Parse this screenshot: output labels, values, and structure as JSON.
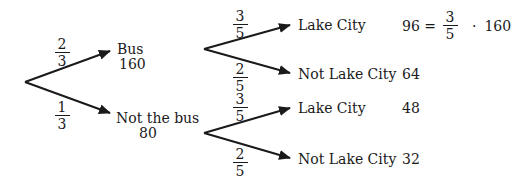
{
  "diagram": {
    "type": "probability-tree",
    "root": {
      "branches": [
        {
          "probability": {
            "num": "2",
            "den": "3"
          },
          "label": "Bus",
          "count": "160",
          "branches": [
            {
              "probability": {
                "num": "3",
                "den": "5"
              },
              "label": "Lake City",
              "value": "96",
              "equation": {
                "lhs": "96 =",
                "num": "3",
                "den": "5",
                "op": "·",
                "rhs": "160"
              }
            },
            {
              "probability": {
                "num": "2",
                "den": "5"
              },
              "label": "Not Lake City",
              "value": "64"
            }
          ]
        },
        {
          "probability": {
            "num": "1",
            "den": "3"
          },
          "label": "Not the bus",
          "count": "80",
          "branches": [
            {
              "probability": {
                "num": "3",
                "den": "5"
              },
              "label": "Lake City",
              "value": "48"
            },
            {
              "probability": {
                "num": "2",
                "den": "5"
              },
              "label": "Not Lake City",
              "value": "32"
            }
          ]
        }
      ]
    }
  }
}
